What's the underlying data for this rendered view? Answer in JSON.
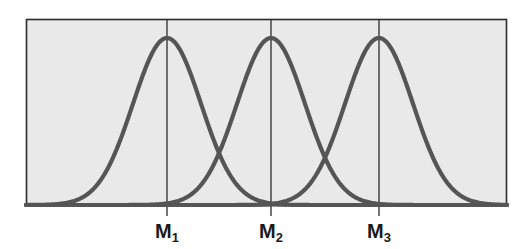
{
  "figure": {
    "name": "three-overlapping-normal-curves",
    "background_color": "#ffffff",
    "plot_fill_color": "#e9e9e9",
    "plot_border_color": "#2b2b2b",
    "curve_color": "#555555",
    "gridline_color": "#2b2b2b",
    "label_color": "#1a1a1a"
  },
  "labels": {
    "m1": "M",
    "m1_sub": "1",
    "m2": "M",
    "m2_sub": "2",
    "m3": "M",
    "m3_sub": "3"
  },
  "chart_data": {
    "type": "line",
    "title": "",
    "subtitle": "",
    "xlabel": "",
    "ylabel": "",
    "grid": false,
    "legend_position": "none",
    "xlim": [
      0,
      100
    ],
    "ylim": [
      0,
      1.12
    ],
    "plot_box_px": {
      "left": 26,
      "top": 19,
      "right": 507,
      "bottom": 206
    },
    "baseline_y_px": 205,
    "peak_y_px": 38,
    "annotations": [
      "M1",
      "M2",
      "M3"
    ],
    "vertical_lines": [
      {
        "label": "M1",
        "x_px": 167
      },
      {
        "label": "M2",
        "x_px": 271
      },
      {
        "label": "M3",
        "x_px": 379
      }
    ],
    "tick_labels": [
      "M₁",
      "M₂",
      "M₃"
    ],
    "tick_positions_px": [
      167,
      271,
      379
    ],
    "series": [
      {
        "name": "Distribution 1",
        "shape": "gaussian",
        "mean_px": 167,
        "sigma_px": 34,
        "peak_height_px": 167,
        "amplitude": 1.0
      },
      {
        "name": "Distribution 2",
        "shape": "gaussian",
        "mean_px": 271,
        "sigma_px": 34,
        "peak_height_px": 167,
        "amplitude": 1.0
      },
      {
        "name": "Distribution 3",
        "shape": "gaussian",
        "mean_px": 379,
        "sigma_px": 34,
        "peak_height_px": 167,
        "amplitude": 1.0
      }
    ],
    "intersections_px": [
      {
        "between": [
          "Distribution 1",
          "Distribution 2"
        ],
        "x_px": 219,
        "y_px": 158
      },
      {
        "between": [
          "Distribution 2",
          "Distribution 3"
        ],
        "x_px": 325,
        "y_px": 158
      }
    ]
  }
}
